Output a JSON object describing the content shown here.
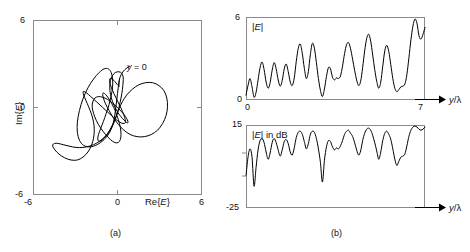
{
  "figure": {
    "panels": [
      {
        "id": "a",
        "caption": "(a)",
        "xlabel": "Re{E}",
        "ylabel": "Im{E}",
        "xticks": [
          "-6",
          "0",
          "6"
        ],
        "yticks": [
          "6",
          "0",
          "-6"
        ],
        "annotation": "y = 0",
        "annotation_symbol": "y",
        "annotation_rest": " = 0"
      },
      {
        "id": "b",
        "caption": "(b)",
        "top": {
          "inplot_label": "|E|",
          "ymax": "6",
          "ymin": "0",
          "xmin": "0",
          "xmax": "7",
          "xlabel": "y/λ"
        },
        "bottom": {
          "inplot_label": "|E| in dB",
          "ymax": "15",
          "ymin": "-25",
          "xlabel": "y/λ"
        }
      }
    ]
  },
  "chart_data": [
    {
      "type": "line",
      "panel": "a",
      "title": "Phasor locus of received field in the complex plane",
      "xlabel": "Re{E}",
      "ylabel": "Im{E}",
      "xlim": [
        -6,
        6
      ],
      "ylim": [
        -6,
        6
      ],
      "xticks": [
        -6,
        0,
        6
      ],
      "yticks": [
        -6,
        0,
        6
      ],
      "grid": false,
      "legend": null,
      "annotations": [
        {
          "text": "y = 0",
          "x": 0.55,
          "y": 1.55,
          "note": "marks the starting point of the locus"
        }
      ],
      "series": [
        {
          "name": "E(y) locus",
          "comment": "Multi-loop spiral trace; points are (Re{E}, Im{E}) sampled along y",
          "points": [
            [
              0.15,
              1.95
            ],
            [
              0.05,
              1.35
            ],
            [
              -0.05,
              0.55
            ],
            [
              -0.15,
              -0.25
            ],
            [
              -0.3,
              -1.05
            ],
            [
              -0.55,
              -1.7
            ],
            [
              -0.95,
              -2.2
            ],
            [
              -1.45,
              -2.55
            ],
            [
              -1.95,
              -2.7
            ],
            [
              -2.4,
              -2.6
            ],
            [
              -2.7,
              -2.25
            ],
            [
              -2.85,
              -1.7
            ],
            [
              -2.85,
              -1.0
            ],
            [
              -2.7,
              -0.2
            ],
            [
              -2.45,
              0.6
            ],
            [
              -2.1,
              1.35
            ],
            [
              -1.7,
              1.95
            ],
            [
              -1.3,
              2.4
            ],
            [
              -0.95,
              2.65
            ],
            [
              -0.65,
              2.65
            ],
            [
              -0.45,
              2.4
            ],
            [
              -0.35,
              1.95
            ],
            [
              -0.35,
              1.4
            ],
            [
              -0.45,
              0.8
            ],
            [
              -0.6,
              0.2
            ],
            [
              -0.8,
              -0.4
            ],
            [
              -1.0,
              -0.95
            ],
            [
              -1.2,
              -1.45
            ],
            [
              -1.35,
              -1.85
            ],
            [
              -1.4,
              -2.15
            ],
            [
              -1.35,
              -2.3
            ],
            [
              -1.2,
              -2.3
            ],
            [
              -0.95,
              -2.1
            ],
            [
              -0.65,
              -1.75
            ],
            [
              -0.35,
              -1.25
            ],
            [
              -0.1,
              -0.65
            ],
            [
              0.1,
              0.0
            ],
            [
              0.25,
              0.65
            ],
            [
              0.35,
              1.25
            ],
            [
              0.4,
              1.75
            ],
            [
              0.4,
              2.1
            ],
            [
              0.3,
              2.35
            ],
            [
              0.1,
              2.45
            ],
            [
              -0.15,
              2.4
            ],
            [
              -0.35,
              2.2
            ],
            [
              -0.5,
              1.85
            ],
            [
              -0.55,
              1.4
            ],
            [
              -0.5,
              0.9
            ],
            [
              -0.35,
              0.4
            ],
            [
              -0.15,
              -0.05
            ],
            [
              0.1,
              -0.45
            ],
            [
              0.35,
              -0.75
            ],
            [
              0.55,
              -0.95
            ],
            [
              0.7,
              -1.05
            ],
            [
              0.75,
              -1.0
            ],
            [
              0.7,
              -0.85
            ],
            [
              0.55,
              -0.6
            ],
            [
              0.3,
              -0.3
            ],
            [
              0.0,
              0.0
            ],
            [
              -0.35,
              0.3
            ],
            [
              -0.7,
              0.55
            ],
            [
              -1.05,
              0.7
            ],
            [
              -1.35,
              0.75
            ],
            [
              -1.6,
              0.65
            ],
            [
              -1.75,
              0.4
            ],
            [
              -1.8,
              0.05
            ],
            [
              -1.7,
              -0.4
            ],
            [
              -1.5,
              -0.9
            ],
            [
              -1.2,
              -1.4
            ],
            [
              -0.85,
              -1.85
            ],
            [
              -0.5,
              -2.2
            ],
            [
              -0.2,
              -2.4
            ],
            [
              0.05,
              -2.4
            ],
            [
              0.2,
              -2.2
            ],
            [
              0.25,
              -1.85
            ],
            [
              0.2,
              -1.35
            ],
            [
              0.05,
              -0.8
            ],
            [
              -0.15,
              -0.25
            ],
            [
              -0.4,
              0.25
            ],
            [
              -0.65,
              0.65
            ],
            [
              -0.85,
              0.9
            ],
            [
              -1.0,
              1.0
            ],
            [
              -1.05,
              0.9
            ],
            [
              -1.0,
              0.65
            ],
            [
              -0.85,
              0.25
            ],
            [
              -0.6,
              -0.2
            ],
            [
              -0.3,
              -0.7
            ],
            [
              0.05,
              -1.15
            ],
            [
              0.45,
              -1.55
            ],
            [
              0.9,
              -1.85
            ],
            [
              1.4,
              -2.0
            ],
            [
              1.9,
              -2.0
            ],
            [
              2.4,
              -1.85
            ],
            [
              2.85,
              -1.55
            ],
            [
              3.2,
              -1.1
            ],
            [
              3.45,
              -0.55
            ],
            [
              3.55,
              0.05
            ],
            [
              3.5,
              0.65
            ],
            [
              3.3,
              1.15
            ],
            [
              2.95,
              1.5
            ],
            [
              2.5,
              1.7
            ],
            [
              2.0,
              1.7
            ],
            [
              1.5,
              1.55
            ],
            [
              1.05,
              1.25
            ],
            [
              0.65,
              0.85
            ],
            [
              0.35,
              0.4
            ],
            [
              0.1,
              -0.1
            ],
            [
              -0.1,
              -0.6
            ],
            [
              -0.3,
              -1.1
            ],
            [
              -0.55,
              -1.55
            ],
            [
              -0.85,
              -1.95
            ],
            [
              -1.25,
              -2.3
            ],
            [
              -1.7,
              -2.55
            ],
            [
              -2.2,
              -2.7
            ],
            [
              -2.7,
              -2.75
            ],
            [
              -3.2,
              -2.7
            ],
            [
              -3.65,
              -2.6
            ],
            [
              -4.05,
              -2.5
            ],
            [
              -4.35,
              -2.45
            ],
            [
              -4.55,
              -2.5
            ],
            [
              -4.6,
              -2.65
            ],
            [
              -4.45,
              -2.9
            ],
            [
              -4.15,
              -3.2
            ],
            [
              -3.75,
              -3.45
            ],
            [
              -3.3,
              -3.6
            ],
            [
              -2.85,
              -3.6
            ],
            [
              -2.45,
              -3.4
            ],
            [
              -2.1,
              -3.05
            ],
            [
              -1.85,
              -2.6
            ],
            [
              -1.7,
              -2.1
            ],
            [
              -1.65,
              -1.55
            ],
            [
              -1.7,
              -1.0
            ],
            [
              -1.85,
              -0.45
            ],
            [
              -2.05,
              0.05
            ],
            [
              -2.25,
              0.5
            ],
            [
              -2.4,
              0.85
            ],
            [
              -2.45,
              1.05
            ],
            [
              -2.4,
              1.1
            ],
            [
              -2.2,
              1.0
            ],
            [
              -1.9,
              0.75
            ],
            [
              -1.5,
              0.4
            ],
            [
              -1.05,
              0.0
            ],
            [
              -0.6,
              -0.4
            ],
            [
              -0.2,
              -0.75
            ],
            [
              0.15,
              -1.0
            ],
            [
              0.4,
              -1.1
            ],
            [
              0.55,
              -1.05
            ],
            [
              0.55,
              -0.85
            ],
            [
              0.45,
              -0.5
            ],
            [
              0.25,
              -0.05
            ],
            [
              0.0,
              0.45
            ],
            [
              -0.25,
              0.95
            ],
            [
              -0.45,
              1.4
            ],
            [
              -0.55,
              1.75
            ],
            [
              -0.55,
              1.95
            ],
            [
              -0.45,
              2.0
            ],
            [
              -0.25,
              1.85
            ],
            [
              0.0,
              1.55
            ]
          ]
        }
      ]
    },
    {
      "type": "line",
      "panel": "b-top",
      "title": "|E|",
      "xlabel": "y/λ",
      "ylabel": "|E|",
      "xlim": [
        0,
        7
      ],
      "ylim": [
        0,
        6
      ],
      "xticks": [
        0,
        7
      ],
      "yticks": [
        0,
        6
      ],
      "grid": false,
      "values": [
        0.35,
        1.05,
        1.55,
        0.95,
        0.2,
        0.55,
        1.45,
        2.35,
        2.75,
        2.2,
        1.3,
        0.85,
        1.25,
        2.15,
        2.7,
        2.25,
        1.45,
        1.0,
        1.4,
        2.25,
        2.6,
        2.05,
        1.3,
        1.05,
        1.6,
        2.8,
        3.75,
        4.05,
        3.35,
        2.3,
        1.55,
        2.05,
        3.3,
        4.1,
        3.75,
        2.7,
        1.55,
        0.7,
        0.25,
        0.8,
        1.7,
        2.35,
        2.25,
        1.65,
        1.45,
        1.6,
        1.55,
        1.75,
        2.45,
        3.35,
        4.0,
        4.15,
        3.7,
        2.95,
        2.15,
        1.45,
        1.05,
        1.35,
        2.35,
        3.55,
        4.45,
        4.75,
        4.25,
        3.25,
        2.2,
        1.35,
        0.85,
        1.3,
        2.45,
        3.55,
        3.95,
        3.5,
        2.55,
        1.55,
        0.85,
        0.6,
        0.75,
        0.95,
        1.0,
        1.15,
        1.85,
        3.05,
        4.35,
        5.35,
        5.85,
        5.55,
        4.65,
        4.4,
        4.75,
        5.25
      ]
    },
    {
      "type": "line",
      "panel": "b-bottom",
      "title": "|E| in dB",
      "xlabel": "y/λ",
      "ylabel": "|E| in dB",
      "xlim": [
        0,
        7
      ],
      "ylim": [
        -25,
        15
      ],
      "yticks": [
        -25,
        15
      ],
      "grid": false,
      "values": [
        -9.5,
        -0.5,
        3.5,
        -0.5,
        -14.5,
        -5.5,
        3.0,
        7.5,
        8.5,
        6.5,
        2.0,
        -1.5,
        1.5,
        6.5,
        8.5,
        6.5,
        3.0,
        0.0,
        3.0,
        7.0,
        8.0,
        6.0,
        2.0,
        0.5,
        4.0,
        9.0,
        11.5,
        12.0,
        10.5,
        7.0,
        3.5,
        6.0,
        10.5,
        12.0,
        11.5,
        8.5,
        3.5,
        -3.0,
        -12.5,
        -2.0,
        4.5,
        7.5,
        7.0,
        4.5,
        3.0,
        4.0,
        3.5,
        5.0,
        7.5,
        10.5,
        12.0,
        12.5,
        11.0,
        9.5,
        6.5,
        3.0,
        0.5,
        2.5,
        7.5,
        11.0,
        13.0,
        13.5,
        12.5,
        10.0,
        6.5,
        2.5,
        -1.5,
        2.0,
        7.5,
        11.0,
        12.0,
        10.5,
        8.0,
        3.5,
        -1.5,
        -4.5,
        -2.5,
        -0.5,
        0.0,
        1.0,
        5.0,
        9.5,
        12.5,
        14.0,
        14.5,
        14.0,
        13.0,
        12.5,
        13.0,
        14.0
      ]
    }
  ]
}
